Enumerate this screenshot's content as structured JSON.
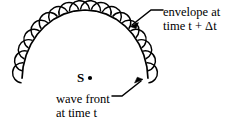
{
  "figure": {
    "background_color": "#ffffff",
    "stroke_color": "#000000"
  },
  "source": {
    "label": "S",
    "marker": "dot"
  },
  "annotations": {
    "envelope": {
      "line1": "envelope at",
      "line2": "time t + Δt",
      "leader": "line-with-arrow",
      "arrow_target": "outer envelope of wavelets"
    },
    "wave_front": {
      "line1": "wave front",
      "line2": "at time t",
      "leader": "line-with-arrow",
      "arrow_target": "primary wave front arc"
    }
  },
  "chart_data": {
    "type": "diagram",
    "elements": [
      {
        "name": "primary-wave-front-arc",
        "kind": "arc",
        "center_x": 85,
        "center_y": 80,
        "radius": 70,
        "start_angle_deg": 181,
        "end_angle_deg": 359
      },
      {
        "name": "secondary-wavelets",
        "kind": "semicircle-series",
        "count": 18,
        "radius": 11,
        "placement": "outward along primary arc"
      },
      {
        "name": "source-point",
        "kind": "point",
        "x": 90,
        "y": 78,
        "label": "S"
      }
    ],
    "labels": [
      "envelope at",
      "time t + Δt",
      "wave front",
      "at time t",
      "S"
    ]
  }
}
